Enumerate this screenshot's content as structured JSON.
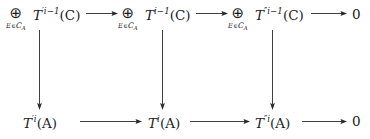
{
  "figure": {
    "kind": "commutative-diagram",
    "background_color": "#ffffff",
    "ink_color": "#1b1b1b",
    "arrow_color": "#2a2a2a",
    "rows": 2,
    "columns": 4
  },
  "symbols": {
    "direct_sum": "⊕",
    "element_of": "∈",
    "script_C": "C",
    "index_subscript": "A",
    "zero": "0",
    "prime": "′",
    "double_prime": "″"
  },
  "top_row": {
    "cells": [
      {
        "id": "top-1",
        "has_big_operator": true,
        "operator": "⊕",
        "operator_subscript_lead": "E",
        "operator_subscript_relation": "∈",
        "operator_subscript_family": "C",
        "operator_subscript_family_index": "A",
        "functor": "T",
        "primes": "′",
        "exponent": "i−1",
        "argument": "(C)",
        "label": "⊕ over E∈C_A of T′^{i-1}(C)"
      },
      {
        "id": "top-2",
        "has_big_operator": true,
        "operator": "⊕",
        "operator_subscript_lead": "E",
        "operator_subscript_relation": "∈",
        "operator_subscript_family": "C",
        "operator_subscript_family_index": "A",
        "functor": "T",
        "primes": "",
        "exponent": "i−1",
        "argument": "(C)",
        "label": "⊕ over E∈C_A of T^{i-1}(C)"
      },
      {
        "id": "top-3",
        "has_big_operator": true,
        "operator": "⊕",
        "operator_subscript_lead": "E",
        "operator_subscript_relation": "∈",
        "operator_subscript_family": "C",
        "operator_subscript_family_index": "A",
        "functor": "T",
        "primes": "″",
        "exponent": "i−1",
        "argument": "(C)",
        "label": "⊕ over E∈C_A of T″^{i-1}(C)"
      },
      {
        "id": "top-4",
        "has_big_operator": false,
        "text": "0",
        "label": "zero object"
      }
    ]
  },
  "bottom_row": {
    "cells": [
      {
        "id": "bottom-1",
        "functor": "T",
        "primes": "′",
        "exponent": "i",
        "argument": "(A)",
        "label": "T′^{i}(A)"
      },
      {
        "id": "bottom-2",
        "functor": "T",
        "primes": "",
        "exponent": "i",
        "argument": "(A)",
        "label": "T^{i}(A)"
      },
      {
        "id": "bottom-3",
        "functor": "T",
        "primes": "″",
        "exponent": "i",
        "argument": "(A)",
        "label": "T″^{i}(A)"
      },
      {
        "id": "bottom-4",
        "has_big_operator": false,
        "text": "0",
        "label": "zero object"
      }
    ]
  },
  "arrows": {
    "horizontal": [
      {
        "id": "h-top-1",
        "row": "top",
        "from": "top-1",
        "to": "top-2",
        "direction": "right",
        "label": ""
      },
      {
        "id": "h-top-2",
        "row": "top",
        "from": "top-2",
        "to": "top-3",
        "direction": "right",
        "label": ""
      },
      {
        "id": "h-top-3",
        "row": "top",
        "from": "top-3",
        "to": "top-4",
        "direction": "right",
        "label": ""
      },
      {
        "id": "h-bottom-1",
        "row": "bottom",
        "from": "bottom-1",
        "to": "bottom-2",
        "direction": "right",
        "label": ""
      },
      {
        "id": "h-bottom-2",
        "row": "bottom",
        "from": "bottom-2",
        "to": "bottom-3",
        "direction": "right",
        "label": ""
      },
      {
        "id": "h-bottom-3",
        "row": "bottom",
        "from": "bottom-3",
        "to": "bottom-4",
        "direction": "right",
        "label": ""
      }
    ],
    "vertical": [
      {
        "id": "v-1",
        "from": "top-1",
        "to": "bottom-1",
        "direction": "down",
        "label": ""
      },
      {
        "id": "v-2",
        "from": "top-2",
        "to": "bottom-2",
        "direction": "down",
        "label": ""
      },
      {
        "id": "v-3",
        "from": "top-3",
        "to": "bottom-3",
        "direction": "down",
        "label": ""
      }
    ]
  }
}
